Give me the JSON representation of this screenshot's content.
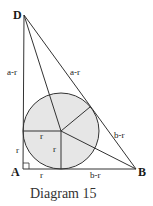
{
  "caption": "Diagram 15",
  "points": {
    "D": "D",
    "A": "A",
    "B": "B"
  },
  "labels": {
    "ad_upper": "a-r",
    "db_upper": "a-r",
    "db_lower": "b-r",
    "ad_lower": "r",
    "ab_left": "r",
    "ab_right": "b-r",
    "radius_horizontal": "r",
    "radius_vertical": "r"
  },
  "colors": {
    "circle_fill": "#e6e6e6",
    "stroke": "#333333"
  }
}
